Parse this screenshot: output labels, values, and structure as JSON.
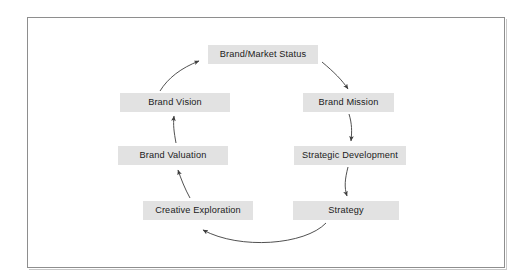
{
  "figure": {
    "type": "cycle-diagram",
    "frame": {
      "border_color": "#8e8e8e",
      "background": "#ffffff"
    },
    "style": {
      "box_fill": "#e2e2e2",
      "text_color": "#1b1b1b",
      "arrow_color": "#3d3d3d"
    },
    "nodes": [
      {
        "id": "brand-market-status",
        "label": "Brand/Market Status",
        "position": "top",
        "box": {
          "x": 208,
          "y": 45,
          "w": 110,
          "h": 19
        }
      },
      {
        "id": "brand-mission",
        "label": "Brand Mission",
        "position": "upper-right",
        "box": {
          "x": 303,
          "y": 93,
          "w": 91,
          "h": 19
        }
      },
      {
        "id": "strategic-development",
        "label": "Strategic Development",
        "position": "lower-right",
        "box": {
          "x": 294,
          "y": 146,
          "w": 112,
          "h": 19
        }
      },
      {
        "id": "strategy",
        "label": "Strategy",
        "position": "bottom-right",
        "box": {
          "x": 293,
          "y": 201,
          "w": 106,
          "h": 19
        }
      },
      {
        "id": "creative-exploration",
        "label": "Creative Exploration",
        "position": "bottom-left",
        "box": {
          "x": 143,
          "y": 201,
          "w": 110,
          "h": 19
        }
      },
      {
        "id": "brand-valuation",
        "label": "Brand Valuation",
        "position": "lower-left",
        "box": {
          "x": 118,
          "y": 146,
          "w": 110,
          "h": 19
        }
      },
      {
        "id": "brand-vision",
        "label": "Brand Vision",
        "position": "upper-left",
        "box": {
          "x": 120,
          "y": 93,
          "w": 110,
          "h": 19
        }
      }
    ],
    "edges": [
      {
        "id": "edge-status-to-mission",
        "from": "brand-market-status",
        "to": "brand-mission",
        "direction": "clockwise"
      },
      {
        "id": "edge-mission-to-strategic-development",
        "from": "brand-mission",
        "to": "strategic-development",
        "direction": "clockwise"
      },
      {
        "id": "edge-strategic-development-to-strategy",
        "from": "strategic-development",
        "to": "strategy",
        "direction": "clockwise"
      },
      {
        "id": "edge-strategy-to-creative-exploration",
        "from": "strategy",
        "to": "creative-exploration",
        "direction": "clockwise"
      },
      {
        "id": "edge-creative-exploration-to-brand-valuation",
        "from": "creative-exploration",
        "to": "brand-valuation",
        "direction": "clockwise"
      },
      {
        "id": "edge-brand-valuation-to-brand-vision",
        "from": "brand-valuation",
        "to": "brand-vision",
        "direction": "clockwise"
      },
      {
        "id": "edge-brand-vision-to-status",
        "from": "brand-vision",
        "to": "brand-market-status",
        "direction": "clockwise"
      }
    ]
  }
}
